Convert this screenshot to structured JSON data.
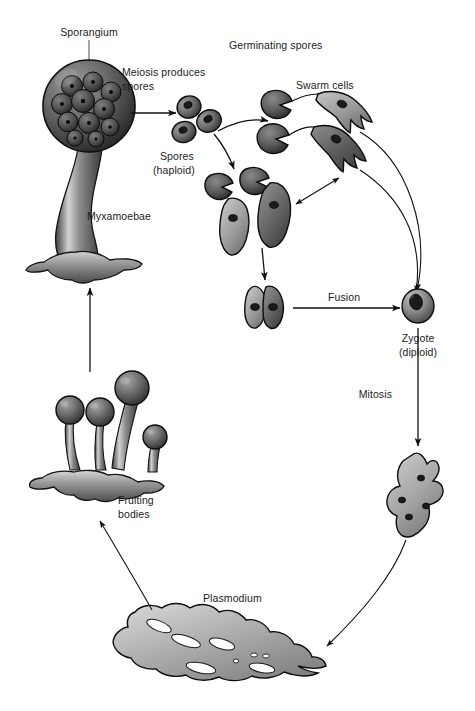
{
  "figure": {
    "width": 475,
    "height": 711,
    "background": "#ffffff",
    "ink_color": "#1c1c1c",
    "cell_fill_light": "#b9b9b9",
    "cell_fill_mid": "#8e8e8e",
    "cell_fill_dark": "#595959"
  },
  "labels": {
    "sporangium": "Sporangium",
    "meiosis_produces": "Meiosis produces",
    "meiosis_spores": "spores",
    "germinating_spores": "Germinating spores",
    "swarm_cells": "Swarm cells",
    "spores": "Spores",
    "spores_haploid": "(haploid)",
    "myxamoebae": "Myxamoebae",
    "fusion": "Fusion",
    "zygote": "Zygote",
    "zygote_diploid": "(diploid)",
    "mitosis": "Mitosis",
    "plasmodium": "Plasmodium",
    "fruiting": "Fruiting",
    "fruiting_bodies": "bodies"
  },
  "stages": [
    {
      "id": "sporangium",
      "label": "Sporangium",
      "description": "Stalked sporangium containing spores",
      "ploidy": "diploid-to-haploid"
    },
    {
      "id": "spores",
      "label": "Spores",
      "sublabel": "(haploid)",
      "count_shown": 3,
      "ploidy": "haploid"
    },
    {
      "id": "germinating-spores",
      "label": "Germinating spores",
      "count_shown": 5,
      "ploidy": "haploid"
    },
    {
      "id": "swarm-cells",
      "label": "Swarm cells",
      "count_shown": 2,
      "ploidy": "haploid"
    },
    {
      "id": "myxamoebae",
      "label": "Myxamoebae",
      "count_shown": 3,
      "ploidy": "haploid"
    },
    {
      "id": "fusing-cells",
      "label": "Fusion",
      "count_shown": 2,
      "ploidy": "haploid"
    },
    {
      "id": "zygote",
      "label": "Zygote",
      "sublabel": "(diploid)",
      "ploidy": "diploid"
    },
    {
      "id": "young-plasmodium",
      "label": "Mitosis",
      "nuclei_shown": 4,
      "ploidy": "diploid"
    },
    {
      "id": "plasmodium",
      "label": "Plasmodium",
      "ploidy": "diploid multinucleate"
    },
    {
      "id": "fruiting-bodies",
      "label": "Fruiting bodies",
      "count_shown": 4,
      "ploidy": "diploid"
    }
  ],
  "transitions": [
    {
      "from": "sporangium",
      "to": "spores",
      "label": "Meiosis produces spores",
      "arrow": "straight"
    },
    {
      "from": "spores",
      "to": "germinating-spores",
      "label": "",
      "arrow": "curved"
    },
    {
      "from": "spores",
      "to": "myxamoebae",
      "label": "",
      "arrow": "curved"
    },
    {
      "from": "germinating-spores",
      "to": "swarm-cells",
      "label": "",
      "arrow": "curved"
    },
    {
      "from": "myxamoebae",
      "to": "swarm-cells",
      "label": "",
      "arrow": "double"
    },
    {
      "from": "myxamoebae",
      "to": "fusing-cells",
      "label": "",
      "arrow": "straight"
    },
    {
      "from": "fusing-cells",
      "to": "zygote",
      "label": "Fusion",
      "arrow": "straight"
    },
    {
      "from": "swarm-cells",
      "to": "zygote",
      "label": "",
      "arrow": "curved"
    },
    {
      "from": "zygote",
      "to": "young-plasmodium",
      "label": "Mitosis",
      "arrow": "straight"
    },
    {
      "from": "young-plasmodium",
      "to": "plasmodium",
      "label": "",
      "arrow": "curved"
    },
    {
      "from": "plasmodium",
      "to": "fruiting-bodies",
      "label": "",
      "arrow": "curved"
    },
    {
      "from": "fruiting-bodies",
      "to": "sporangium",
      "label": "",
      "arrow": "straight"
    }
  ]
}
